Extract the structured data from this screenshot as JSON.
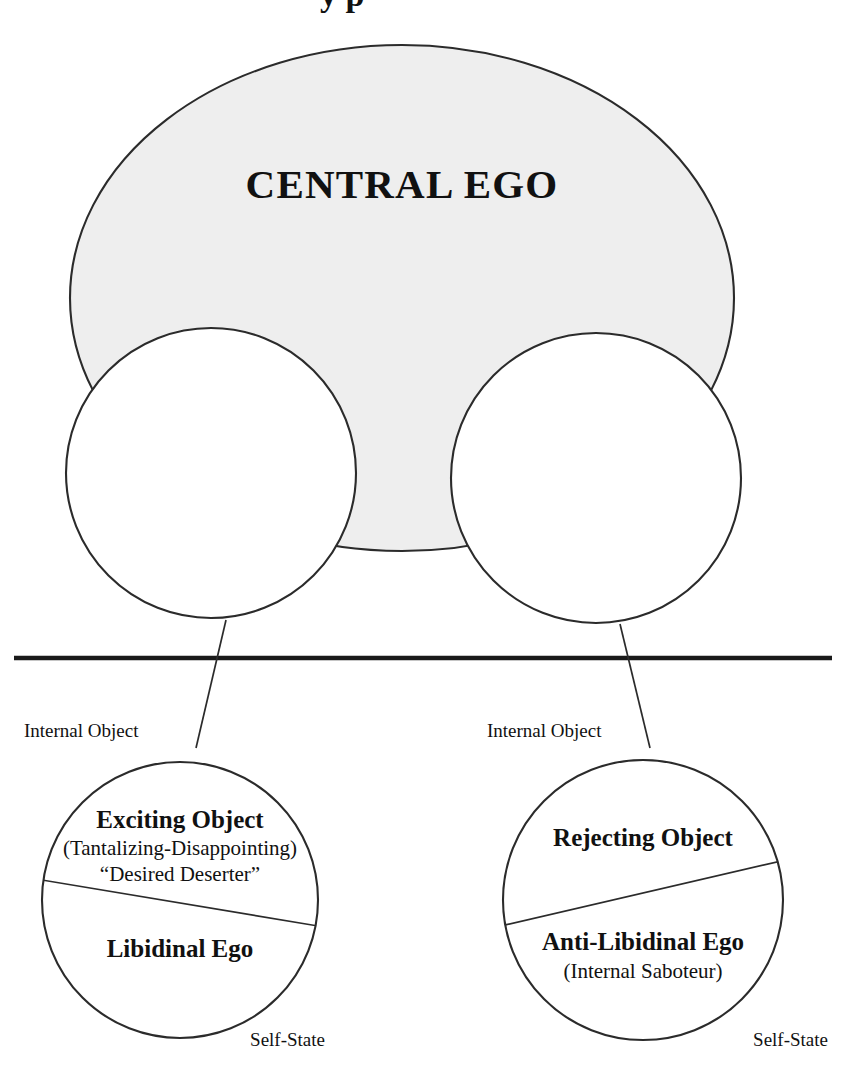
{
  "figure": {
    "title_partial": "y    p",
    "central_ego": {
      "label": "CENTRAL EGO"
    },
    "divider": {
      "name": "repression-barrier"
    },
    "left_structure": {
      "internal_object_label": "Internal Object",
      "self_state_label": "Self-State",
      "upper_title": "Exciting Object",
      "upper_sub1": "(Tantalizing-Disappointing)",
      "upper_sub2": "“Desired Deserter”",
      "lower_title": "Libidinal Ego"
    },
    "right_structure": {
      "internal_object_label": "Internal Object",
      "self_state_label": "Self-State",
      "upper_title": "Rejecting Object",
      "lower_title": "Anti-Libidinal Ego",
      "lower_sub1": "(Internal Saboteur)"
    },
    "colors": {
      "central_ego_fill": "#eeeeee",
      "stroke": "#2b2b2b",
      "divider": "#1a1a1a",
      "page_background": "#ffffff",
      "text": "#111111"
    }
  }
}
